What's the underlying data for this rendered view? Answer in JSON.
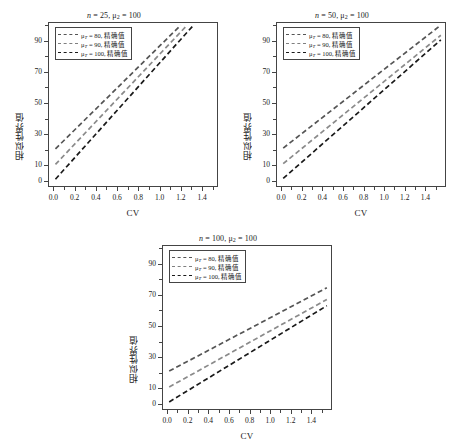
{
  "figure": {
    "axis_labels": {
      "x": "CV",
      "y": "相似性界值"
    },
    "legend_entries": [
      {
        "mu": "80",
        "label": "精确值",
        "style": "dashed-gray-dark"
      },
      {
        "mu": "90",
        "label": "精确值",
        "style": "dashed-gray"
      },
      {
        "mu": "100",
        "label": "精确值",
        "style": "dashed-black"
      }
    ],
    "legend_symbol": "μ",
    "legend_subscript": "T",
    "legend_equals": "=",
    "legend_comma": ", "
  },
  "chart_data": [
    {
      "type": "line",
      "panel": "top-left",
      "title": "n = 25, μ₂ = 100",
      "title_parts": {
        "n_symbol": "n",
        "n_value": "25",
        "mu_symbol": "μ",
        "mu_sub": "2",
        "mu_value": "100"
      },
      "xlabel": "CV",
      "ylabel": "相似性界值",
      "xlim": [
        -0.05,
        1.55
      ],
      "ylim": [
        -4,
        102
      ],
      "xticks": [
        0.0,
        0.2,
        0.4,
        0.6,
        0.8,
        1.0,
        1.2,
        1.4
      ],
      "xtick_labels": [
        "0.0",
        "0.2",
        "0.4",
        "0.6",
        "0.8",
        "1.0",
        "1.2",
        "1.4"
      ],
      "yticks": [
        0,
        10,
        30,
        50,
        70,
        90
      ],
      "ytick_labels": [
        "0",
        "10",
        "30",
        "50",
        "70",
        "90"
      ],
      "grid": false,
      "legend_position": "top-left",
      "series": [
        {
          "name": "μT = 80, 精确值",
          "color": "#555555",
          "dash": "5,3",
          "x": [
            0.02,
            1.2
          ],
          "y": [
            20.5,
            100.0
          ]
        },
        {
          "name": "μT = 90, 精确值",
          "color": "#8a8a8a",
          "dash": "5,3",
          "x": [
            0.02,
            1.26
          ],
          "y": [
            10.5,
            100.0
          ]
        },
        {
          "name": "μT = 100, 精确值",
          "color": "#1a1a1a",
          "dash": "5,3",
          "x": [
            0.02,
            1.32
          ],
          "y": [
            1.0,
            100.0
          ]
        }
      ]
    },
    {
      "type": "line",
      "panel": "top-right",
      "title": "n = 50, μ₂ = 100",
      "title_parts": {
        "n_symbol": "n",
        "n_value": "50",
        "mu_symbol": "μ",
        "mu_sub": "2",
        "mu_value": "100"
      },
      "xlabel": "CV",
      "ylabel": "相似性界值",
      "xlim": [
        -0.05,
        1.6
      ],
      "ylim": [
        -4,
        102
      ],
      "xticks": [
        0.0,
        0.2,
        0.4,
        0.6,
        0.8,
        1.0,
        1.2,
        1.4
      ],
      "xtick_labels": [
        "0.0",
        "0.2",
        "0.4",
        "0.6",
        "0.8",
        "1.0",
        "1.2",
        "1.4"
      ],
      "yticks": [
        0,
        10,
        30,
        50,
        70,
        90
      ],
      "ytick_labels": [
        "0",
        "10",
        "30",
        "50",
        "70",
        "90"
      ],
      "grid": false,
      "legend_position": "top-left",
      "series": [
        {
          "name": "μT = 80, 精确值",
          "color": "#555555",
          "dash": "5,3",
          "x": [
            0.02,
            1.55
          ],
          "y": [
            21.0,
            100.0
          ]
        },
        {
          "name": "μT = 90, 精确值",
          "color": "#8a8a8a",
          "dash": "5,3",
          "x": [
            0.02,
            1.55
          ],
          "y": [
            11.0,
            93.5
          ]
        },
        {
          "name": "μT = 100, 精确值",
          "color": "#1a1a1a",
          "dash": "5,3",
          "x": [
            0.02,
            1.55
          ],
          "y": [
            1.5,
            90.5
          ]
        }
      ]
    },
    {
      "type": "line",
      "panel": "bottom-center",
      "title": "n = 100, μ₂ = 100",
      "title_parts": {
        "n_symbol": "n",
        "n_value": "100",
        "mu_symbol": "μ",
        "mu_sub": "2",
        "mu_value": "100"
      },
      "xlabel": "CV",
      "ylabel": "相似性界值",
      "xlim": [
        -0.05,
        1.6
      ],
      "ylim": [
        -4,
        102
      ],
      "xticks": [
        0.0,
        0.2,
        0.4,
        0.6,
        0.8,
        1.0,
        1.2,
        1.4
      ],
      "xtick_labels": [
        "0.0",
        "0.2",
        "0.4",
        "0.6",
        "0.8",
        "1.0",
        "1.2",
        "1.4"
      ],
      "yticks": [
        0,
        10,
        30,
        50,
        70,
        90
      ],
      "ytick_labels": [
        "0",
        "10",
        "30",
        "50",
        "70",
        "90"
      ],
      "grid": false,
      "legend_position": "top-left",
      "series": [
        {
          "name": "μT = 80, 精确值",
          "color": "#555555",
          "dash": "5,3",
          "x": [
            0.02,
            1.55
          ],
          "y": [
            21.0,
            74.5
          ]
        },
        {
          "name": "μT = 90, 精确值",
          "color": "#8a8a8a",
          "dash": "5,3",
          "x": [
            0.02,
            1.55
          ],
          "y": [
            10.8,
            67.0
          ]
        },
        {
          "name": "μT = 100, 精确值",
          "color": "#1a1a1a",
          "dash": "5,3",
          "x": [
            0.02,
            1.55
          ],
          "y": [
            1.2,
            63.0
          ]
        }
      ]
    }
  ]
}
